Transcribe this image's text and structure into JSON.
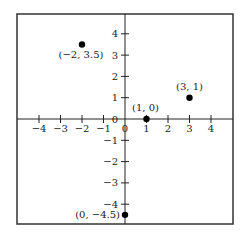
{
  "chart_data": {
    "type": "scatter",
    "title": "",
    "xlabel": "",
    "ylabel": "",
    "xlim": [
      -5,
      5
    ],
    "ylim": [
      -5,
      5
    ],
    "grid": false,
    "x_ticks": [
      -4,
      -3,
      -2,
      -1,
      0,
      1,
      2,
      3,
      4
    ],
    "y_ticks": [
      -4,
      -3,
      -2,
      -1,
      0,
      1,
      2,
      3,
      4
    ],
    "x_tick_labels": [
      "−4",
      "−3",
      "−2",
      "−1",
      "0",
      "1",
      "2",
      "3",
      "4"
    ],
    "y_tick_labels": [
      "−4",
      "−3",
      "−2",
      "−1",
      "0",
      "1",
      "2",
      "3",
      "4"
    ],
    "points": [
      {
        "x": -2,
        "y": 3.5,
        "label": "(−2, 3.5)"
      },
      {
        "x": 3,
        "y": 1,
        "label": "(3, 1)"
      },
      {
        "x": 1,
        "y": 0,
        "label": "(1, 0)"
      },
      {
        "x": 0,
        "y": -4.5,
        "label": "(0, −4.5)"
      }
    ]
  },
  "colors": {
    "axis": "#222222",
    "frame": "#333333",
    "point": "#000000",
    "background": "#ffffff"
  }
}
